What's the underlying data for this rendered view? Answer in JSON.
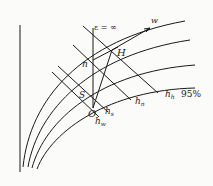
{
  "diagram": {
    "labels": {
      "epsilon": "ε = ∞",
      "w": "w",
      "H": "H",
      "n": "n",
      "S": "S",
      "O": "O",
      "h_h": "h",
      "h_h_sub": "h",
      "percent": "95%",
      "h_n": "h",
      "h_n_sub": "n",
      "h_s": "h",
      "h_s_sub": "s",
      "h_w": "h",
      "h_w_sub": "w"
    },
    "colors": {
      "stroke": "#1a1a1a",
      "background": "#fbfbfa"
    }
  }
}
